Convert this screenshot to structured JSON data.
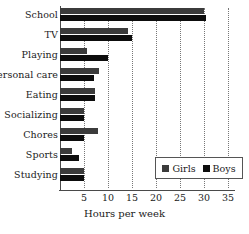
{
  "chart_data": {
    "type": "bar",
    "orientation": "horizontal",
    "title": "",
    "xlabel": "Hours per week",
    "ylabel": "",
    "xlim": [
      0,
      37
    ],
    "xticks": [
      5,
      10,
      15,
      20,
      25,
      30,
      35
    ],
    "xtick_labels": [
      "5",
      "10",
      "15",
      "20",
      "25",
      "30",
      "35"
    ],
    "grid": "vertical-dotted",
    "legend_position": "lower-right",
    "categories": [
      "School",
      "TV",
      "Playing",
      "Personal care",
      "Eating",
      "Socializing",
      "Chores",
      "Sports",
      "Studying"
    ],
    "series": [
      {
        "name": "Girls",
        "color": "#3b3b3b",
        "values": [
          30.0,
          14.2,
          5.6,
          8.2,
          7.3,
          5.0,
          7.9,
          2.5,
          5.0
        ]
      },
      {
        "name": "Boys",
        "color": "#0d0d0d",
        "values": [
          30.5,
          15.0,
          10.0,
          7.1,
          7.3,
          4.9,
          5.0,
          4.0,
          5.0
        ]
      }
    ]
  },
  "legend": {
    "entries": [
      {
        "label": "Girls"
      },
      {
        "label": "Boys"
      }
    ]
  }
}
